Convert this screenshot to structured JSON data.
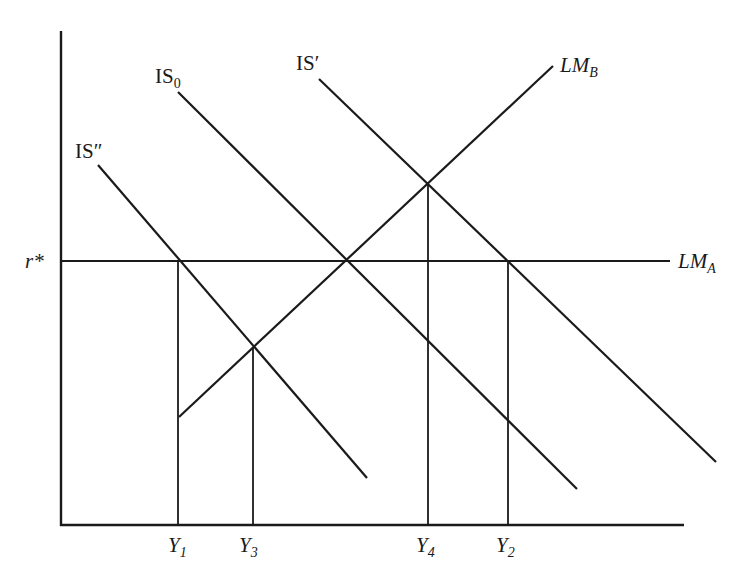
{
  "diagram": {
    "line_color": "#1a1a1a",
    "background": "#ffffff",
    "axes": {
      "origin": [
        61,
        525
      ],
      "y_top": 31,
      "x_right": 684,
      "y_tick_label": {
        "base": "r",
        "suffix": "*"
      }
    },
    "curves": [
      {
        "id": "IS_double_prime",
        "label_base": "IS",
        "label_suffix": "″",
        "from": [
          98,
          165
        ],
        "to": [
          367,
          478
        ]
      },
      {
        "id": "IS0",
        "label_base": "IS",
        "label_sub": "0",
        "from": [
          178,
          92
        ],
        "to": [
          577,
          489
        ]
      },
      {
        "id": "IS_prime",
        "label_base": "IS",
        "label_suffix": "′",
        "from": [
          319,
          79
        ],
        "to": [
          716,
          462
        ]
      },
      {
        "id": "LM_B",
        "label_base": "LM",
        "label_sub": "B",
        "from": [
          179,
          417
        ],
        "to": [
          553,
          66
        ]
      },
      {
        "id": "LM_A",
        "label_base": "LM",
        "label_sub": "A",
        "from": [
          61,
          261
        ],
        "to": [
          670,
          261
        ]
      }
    ],
    "x_ticks": [
      {
        "label_base": "Y",
        "label_sub": "1",
        "x": 178,
        "top": 261
      },
      {
        "label_base": "Y",
        "label_sub": "3",
        "x": 253,
        "top": 347
      },
      {
        "label_base": "Y",
        "label_sub": "4",
        "x": 428,
        "top": 183
      },
      {
        "label_base": "Y",
        "label_sub": "2",
        "x": 508,
        "top": 261
      }
    ],
    "labels": {
      "is_double_prime": {
        "base": "IS",
        "suffix": "″"
      },
      "is0": {
        "base": "IS",
        "sub": "0"
      },
      "is_prime": {
        "base": "IS",
        "suffix": "′"
      },
      "lm_b": {
        "base": "LM",
        "sub": "B"
      },
      "lm_a": {
        "base": "LM",
        "sub": "A"
      },
      "r_star": {
        "base": "r",
        "suffix": "*"
      },
      "y1": {
        "base": "Y",
        "sub": "1"
      },
      "y3": {
        "base": "Y",
        "sub": "3"
      },
      "y4": {
        "base": "Y",
        "sub": "4"
      },
      "y2": {
        "base": "Y",
        "sub": "2"
      }
    }
  }
}
